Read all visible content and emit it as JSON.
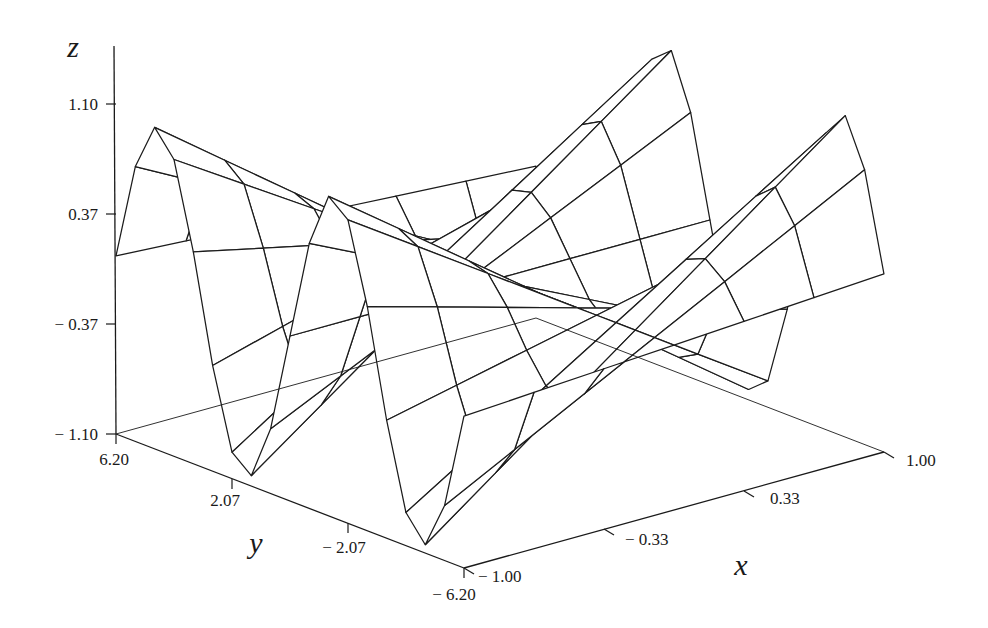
{
  "chart_data": {
    "type": "surface3d",
    "title": "",
    "function": "z = x * sin(y)",
    "xlabel": "x",
    "ylabel": "y",
    "zlabel": "z",
    "x_ticks": [
      "-1.00",
      "-0.33",
      "0.33",
      "1.00"
    ],
    "y_ticks": [
      "6.20",
      "2.07",
      "-2.07",
      "-6.20"
    ],
    "z_ticks": [
      "1.10",
      "0.37",
      "-0.37",
      "-1.10"
    ],
    "xlim": [
      -1.0,
      1.0
    ],
    "ylim": [
      -6.2,
      6.2
    ],
    "zlim": [
      -1.1,
      1.1
    ],
    "grid": false,
    "legend": "none",
    "mesh": {
      "x_lines": 7,
      "y_lines": 19
    },
    "style": {
      "line_color": "#1c1c1c",
      "face_color": "#ffffff",
      "background": "#ffffff"
    }
  },
  "axes": {
    "z": {
      "label": "z",
      "ticks": [
        "1.10",
        "0.37",
        "-0.37",
        "-1.10"
      ]
    },
    "y": {
      "label": "y",
      "ticks": [
        "6.20",
        "2.07",
        "-2.07",
        "-6.20"
      ]
    },
    "x": {
      "label": "x",
      "ticks": [
        "-1.00",
        "-0.33",
        "0.33",
        "1.00"
      ]
    }
  }
}
